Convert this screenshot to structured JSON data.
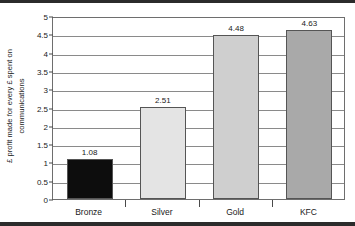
{
  "chart_data": {
    "type": "bar",
    "title": "",
    "subtitle": "",
    "xlabel": "",
    "ylabel_lines": [
      "£ profit made for every £ spent on",
      "communications"
    ],
    "ylabel": "£ profit made for every £ spent on communications",
    "categories": [
      "Bronze",
      "Silver",
      "Gold",
      "KFC"
    ],
    "values": [
      1.08,
      2.51,
      4.48,
      4.63
    ],
    "value_labels": [
      "1.08",
      "2.51",
      "4.48",
      "4.63"
    ],
    "bar_colors": [
      "#0d0d0d",
      "#e4e4e4",
      "#cfcfcf",
      "#a9a9a9"
    ],
    "bar_border_color": "#555555",
    "ylim": [
      0,
      5
    ],
    "ytick_labels": [
      "0",
      "0.5",
      "1",
      "1.5",
      "2",
      "2.5",
      "3",
      "3.5",
      "4",
      "4.5",
      "5"
    ],
    "ytick_values": [
      0,
      0.5,
      1,
      1.5,
      2,
      2.5,
      3,
      3.5,
      4,
      4.5,
      5
    ],
    "grid": true,
    "grid_axis": "y",
    "legend": false,
    "legend_position": "none",
    "frame_color": "#6e6e6e",
    "text_color": "#1a1a1a",
    "border_color": "#2b2b2b"
  }
}
